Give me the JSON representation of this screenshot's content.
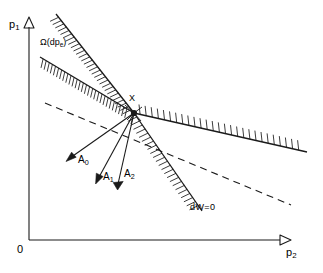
{
  "figure": {
    "type": "diagram",
    "background_color": "#ffffff",
    "stroke_color": "#1a1a1a",
    "width": 323,
    "height": 273
  },
  "axes": {
    "y_label": "p",
    "y_label_sub": "1",
    "x_label": "p",
    "x_label_sub": "2",
    "origin_label": "0",
    "y_axis": {
      "x": 29,
      "y_top": 22,
      "y_bottom": 240
    },
    "x_axis": {
      "y": 240,
      "x_left": 29,
      "x_right": 284
    },
    "arrowhead_style": "open-triangle"
  },
  "point": {
    "label": "X",
    "x": 134,
    "y": 113
  },
  "cone": {
    "label": "Ω(dp",
    "label_sub": "e",
    "label_close": ")",
    "label_x": 40,
    "label_y": 43,
    "upper_edge": {
      "x1": 134,
      "y1": 113,
      "x2": 56,
      "y2": 14
    },
    "lower_edge": {
      "x1": 134,
      "y1": 113,
      "x2": 40,
      "y2": 57
    },
    "hatch_side": "outside"
  },
  "right_ray": {
    "label": "",
    "from": {
      "x": 134,
      "y": 113
    },
    "to": {
      "x": 307,
      "y": 152
    },
    "hatch_side": "above"
  },
  "dw_ray": {
    "label": "dW=0",
    "label_x": 190,
    "label_y": 208,
    "from": {
      "x": 134,
      "y": 113
    },
    "to": {
      "x": 200,
      "y": 208
    },
    "hatch_side": "left"
  },
  "dashed_line": {
    "from": {
      "x": 45,
      "y": 103
    },
    "to": {
      "x": 291,
      "y": 205
    },
    "style": "dashed"
  },
  "vectors": [
    {
      "name": "A",
      "sub": "0",
      "tip_x": 68,
      "tip_y": 160,
      "label_x": 78,
      "label_y": 158
    },
    {
      "name": "A",
      "sub": "1",
      "tip_x": 97,
      "tip_y": 183,
      "label_x": 103,
      "label_y": 175
    },
    {
      "name": "A",
      "sub": "2",
      "tip_x": 118,
      "tip_y": 189,
      "label_x": 123,
      "label_y": 172
    }
  ]
}
